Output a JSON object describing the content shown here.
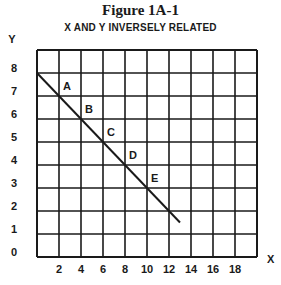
{
  "figure": {
    "title": "Figure 1A-1",
    "subtitle": "X AND Y INVERSELY RELATED"
  },
  "chart_data": {
    "type": "line",
    "title": "Figure 1A-1",
    "subtitle": "X AND Y INVERSELY RELATED",
    "xlabel": "X",
    "ylabel": "Y",
    "xlim": [
      0,
      20
    ],
    "ylim": [
      0,
      9
    ],
    "grid": true,
    "x_ticks": [
      2,
      4,
      6,
      8,
      10,
      12,
      14,
      16,
      18
    ],
    "y_ticks": [
      0,
      1,
      2,
      3,
      4,
      5,
      6,
      7,
      8
    ],
    "series": [
      {
        "name": "inverse relation",
        "x": [
          0,
          2,
          4,
          6,
          8,
          10,
          12,
          13
        ],
        "y": [
          8,
          7,
          6,
          5,
          4,
          3,
          2,
          1.5
        ]
      }
    ],
    "annotations": [
      {
        "label": "A",
        "x": 2,
        "y": 7
      },
      {
        "label": "B",
        "x": 4,
        "y": 6
      },
      {
        "label": "C",
        "x": 6,
        "y": 5
      },
      {
        "label": "D",
        "x": 8,
        "y": 4
      },
      {
        "label": "E",
        "x": 10,
        "y": 3
      }
    ]
  }
}
